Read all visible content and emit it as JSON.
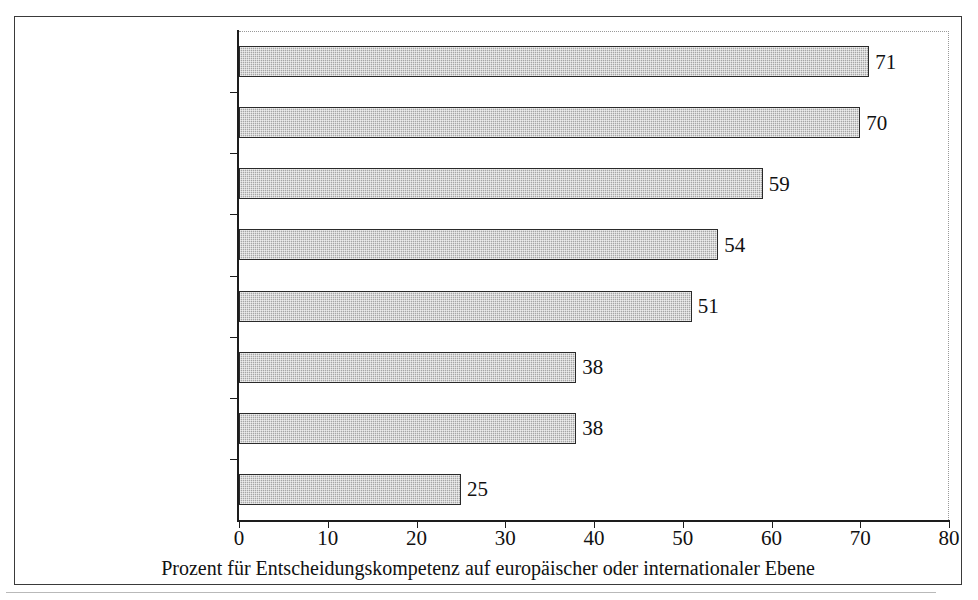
{
  "chart_data": {
    "type": "bar",
    "orientation": "horizontal",
    "title": "",
    "xlabel": "Prozent für Entscheidungskompetenz auf europäischer oder internationaler Ebene",
    "ylabel": "",
    "xlim": [
      0,
      80
    ],
    "xticks": [
      "0",
      "10",
      "20",
      "30",
      "40",
      "50",
      "60",
      "70",
      "80"
    ],
    "xtick_values": [
      0,
      10,
      20,
      30,
      40,
      50,
      60,
      70,
      80
    ],
    "grid": false,
    "legend": "none",
    "bar_color": "#a6a6a6",
    "bar_edge_color": "#2a2a2a",
    "categories": [
      "Entwicklungshilfe",
      "Kampf gegen das organisierte Verbrechen",
      "Umweltschutz",
      "Einwanderung und Flüchtlinge",
      "Verteidigung",
      "Festlegung von Zinssätzen",
      "Landwirtschaft",
      "soziale Sicherheit"
    ],
    "category_lines": [
      [
        "Entwicklungshilfe"
      ],
      [
        "Kampf gegen das",
        "organisierte Verbrechen"
      ],
      [
        "Umweltschutz"
      ],
      [
        "Einwanderung und",
        "Flüchtlinge"
      ],
      [
        "Verteidigung"
      ],
      [
        "Festlegung von Zinssätzen"
      ],
      [
        "Landwirtschaft"
      ],
      [
        "soziale Sicherheit"
      ]
    ],
    "values": [
      71,
      70,
      59,
      54,
      51,
      38,
      38,
      25
    ],
    "value_labels": [
      "71",
      "70",
      "59",
      "54",
      "51",
      "38",
      "38",
      "25"
    ]
  }
}
